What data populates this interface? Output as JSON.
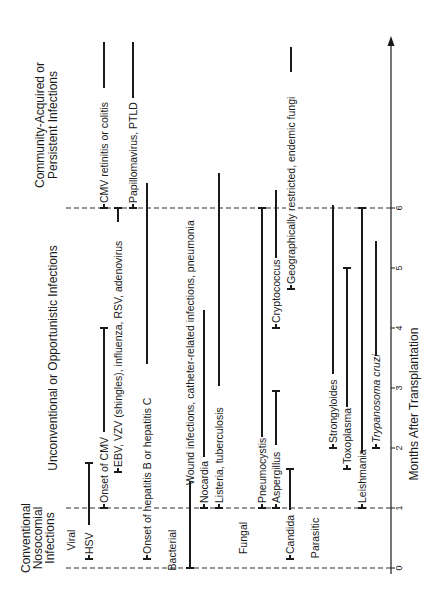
{
  "diagram": {
    "title_axis": "Months After Transplantation",
    "axis_ticks": [
      "0",
      "1",
      "2",
      "3",
      "4",
      "5",
      "6"
    ],
    "period_headers": {
      "conventional": [
        "Conventional",
        "Nosocomial",
        "Infections"
      ],
      "unconventional": "Unconventional or Opportunistic Infections",
      "community": [
        "Community-Acquired or",
        "Persistent Infections"
      ]
    },
    "categories": {
      "viral": "Viral",
      "bacterial": "Bacterial",
      "fungal": "Fungal",
      "parasitic": "Parasitic"
    },
    "infections": [
      {
        "label": "HSV",
        "category": "Viral",
        "start": 0.15,
        "end": 1.75
      },
      {
        "label": "Onset of CMV",
        "category": "Viral",
        "start": 1.0,
        "end": 4.0
      },
      {
        "label": "EBV, VZV (shingles), influenza, RSV, adenovirus",
        "category": "Viral",
        "start": 1.6,
        "end": 6.0
      },
      {
        "label": "CMV retinitis or colitis",
        "category": "Viral",
        "start": 6.0,
        "end": 8.8
      },
      {
        "label": "Onset of hepatitis B or hepatitis C",
        "category": "Viral",
        "start": 0.15,
        "end": 6.4
      },
      {
        "label": "Papillomavirus, PTLD",
        "category": "Viral",
        "start": 6.0,
        "end": 8.8
      },
      {
        "label": "Wound infections, catheter-related infections, pneumonia",
        "category": "Bacterial",
        "start": 0.0,
        "end": 1.45
      },
      {
        "label": "Nocardia",
        "category": "Bacterial",
        "start": 1.0,
        "end": 4.3
      },
      {
        "label": "Listeria, tuberculosis",
        "category": "Bacterial",
        "start": 1.0,
        "end": 6.6
      },
      {
        "label": "Pneumocystis",
        "category": "Fungal",
        "start": 1.0,
        "end": 6.0
      },
      {
        "label": "Aspergillus",
        "category": "Fungal",
        "start": 1.0,
        "end": 2.95
      },
      {
        "label": "Candida",
        "category": "Fungal",
        "start": 0.15,
        "end": 1.65
      },
      {
        "label": "Cryptococcus",
        "category": "Fungal",
        "start": 4.0,
        "end": 6.3
      },
      {
        "label": "Geographically restricted, endemic fungi",
        "category": "Fungal",
        "start": 4.65,
        "end": 8.7
      },
      {
        "label": "Strongyloides",
        "category": "Parasitic",
        "start": 2.0,
        "end": 6.05
      },
      {
        "label": "Toxoplasma",
        "category": "Parasitic",
        "start": 1.65,
        "end": 5.0
      },
      {
        "label": "Leishmania",
        "category": "Parasitic",
        "start": 1.0,
        "end": 6.0
      },
      {
        "label": "Trypanosoma cruzi",
        "category": "Parasitic",
        "start": 2.0,
        "end": 5.45
      }
    ]
  }
}
